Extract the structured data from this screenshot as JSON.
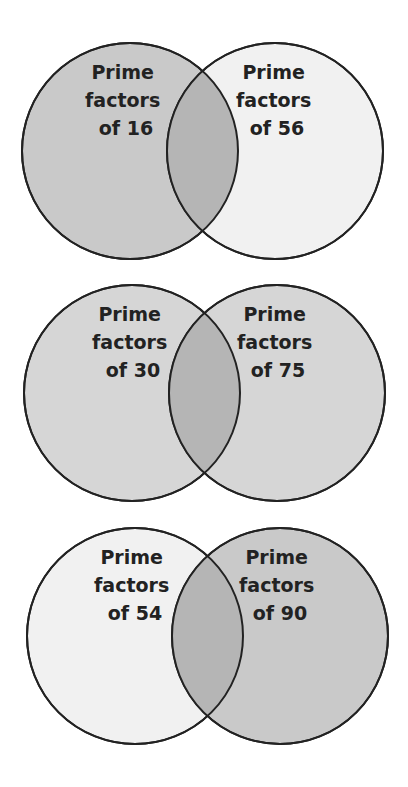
{
  "colors": {
    "dark": "#c9c9c9",
    "mid": "#d6d6d6",
    "light": "#f1f1f1",
    "overlap": "#b5b5b5",
    "stroke": "#222222"
  },
  "diagrams": [
    {
      "left": {
        "lines": [
          "Prime",
          "factors",
          "of 16"
        ],
        "shade": "dark"
      },
      "right": {
        "lines": [
          "Prime",
          "factors",
          "of 56"
        ],
        "shade": "light"
      }
    },
    {
      "left": {
        "lines": [
          "Prime",
          "factors",
          "of 30"
        ],
        "shade": "mid"
      },
      "right": {
        "lines": [
          "Prime",
          "factors",
          "of 75"
        ],
        "shade": "mid"
      }
    },
    {
      "left": {
        "lines": [
          "Prime",
          "factors",
          "of 54"
        ],
        "shade": "light"
      },
      "right": {
        "lines": [
          "Prime",
          "factors",
          "of 90"
        ],
        "shade": "dark"
      }
    }
  ]
}
